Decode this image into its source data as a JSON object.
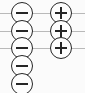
{
  "diagram": {
    "type": "control-stack",
    "canvas": {
      "width": 85,
      "height": 93,
      "background": "#fbfbfb"
    },
    "colors": {
      "rule": "#b9b9b9",
      "node_stroke": "#262626",
      "node_fill": "#fdfdfd",
      "glyph": "#262626"
    },
    "rules": {
      "name": "horizontal-rules",
      "count": 3,
      "orientation": "horizontal",
      "thickness_px": 1,
      "x_start": 0,
      "x_end": 85,
      "y_positions": [
        13,
        31,
        48
      ]
    },
    "columns": [
      {
        "name": "minus-column",
        "glyph": "minus",
        "label": "Zoom out",
        "count": 5,
        "center_x": 22,
        "radius": 11,
        "nodes": [
          {
            "glyph": "minus",
            "center_y": 13,
            "on_rule": 1,
            "clipped": false
          },
          {
            "glyph": "minus",
            "center_y": 31,
            "on_rule": 2,
            "clipped": false
          },
          {
            "glyph": "minus",
            "center_y": 48,
            "on_rule": 3,
            "clipped": false
          },
          {
            "glyph": "minus",
            "center_y": 66,
            "on_rule": null,
            "clipped": false
          },
          {
            "glyph": "minus",
            "center_y": 84,
            "on_rule": null,
            "clipped": true
          }
        ]
      },
      {
        "name": "plus-column",
        "glyph": "plus",
        "label": "Zoom in",
        "count": 3,
        "center_x": 61,
        "radius": 11,
        "nodes": [
          {
            "glyph": "plus",
            "center_y": 13,
            "on_rule": 1,
            "clipped": false
          },
          {
            "glyph": "plus",
            "center_y": 31,
            "on_rule": 2,
            "clipped": false
          },
          {
            "glyph": "plus",
            "center_y": 48,
            "on_rule": 3,
            "clipped": false
          }
        ]
      }
    ]
  }
}
